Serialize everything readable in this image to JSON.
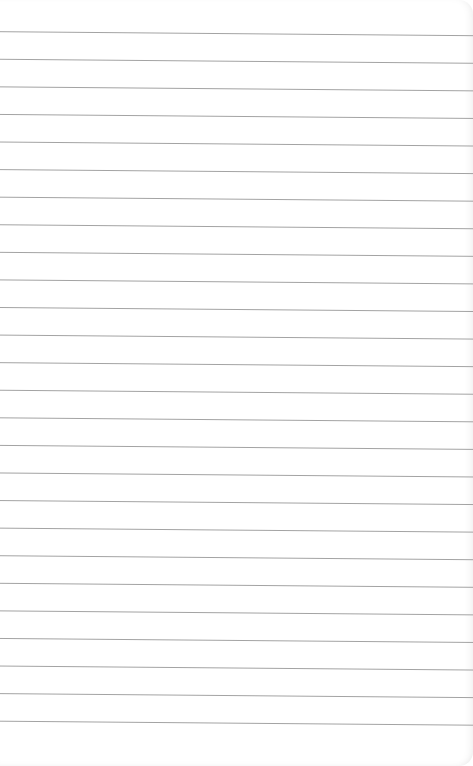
{
  "page": {
    "type": "lined-paper",
    "background_color": "#ffffff",
    "line_color": "#a3a3a3",
    "line_count": 26,
    "first_line_y_left": 31.7,
    "first_line_y_right": 35.7,
    "line_spacing": 27.58,
    "lines": []
  }
}
